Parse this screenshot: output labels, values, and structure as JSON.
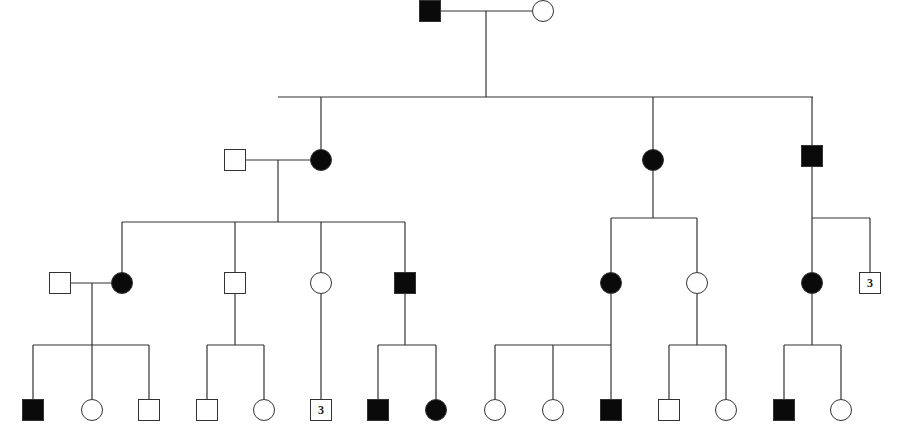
{
  "diagram": {
    "type": "pedigree",
    "legend_colors": {
      "affected": "#0a0a0a",
      "unaffected": "#ffffff",
      "line": "#333333"
    },
    "individuals": [
      {
        "id": "I-1",
        "gen": 1,
        "sex": "male",
        "affected": true,
        "x": 430,
        "y": 11
      },
      {
        "id": "I-2",
        "gen": 1,
        "sex": "female",
        "affected": false,
        "x": 543,
        "y": 11
      },
      {
        "id": "II-spouse",
        "gen": 2,
        "sex": "male",
        "affected": false,
        "x": 235,
        "y": 160
      },
      {
        "id": "II-1",
        "gen": 2,
        "sex": "female",
        "affected": true,
        "x": 321,
        "y": 160
      },
      {
        "id": "II-2",
        "gen": 2,
        "sex": "female",
        "affected": true,
        "x": 653,
        "y": 160
      },
      {
        "id": "II-3",
        "gen": 2,
        "sex": "male",
        "affected": true,
        "x": 812,
        "y": 156
      },
      {
        "id": "III-spouse",
        "gen": 3,
        "sex": "male",
        "affected": false,
        "x": 60,
        "y": 283
      },
      {
        "id": "III-1",
        "gen": 3,
        "sex": "female",
        "affected": true,
        "x": 122,
        "y": 283
      },
      {
        "id": "III-2",
        "gen": 3,
        "sex": "male",
        "affected": false,
        "x": 235,
        "y": 283
      },
      {
        "id": "III-3",
        "gen": 3,
        "sex": "female",
        "affected": false,
        "x": 321,
        "y": 283
      },
      {
        "id": "III-4",
        "gen": 3,
        "sex": "male",
        "affected": true,
        "x": 405,
        "y": 283
      },
      {
        "id": "III-5",
        "gen": 3,
        "sex": "female",
        "affected": true,
        "x": 611,
        "y": 283
      },
      {
        "id": "III-6",
        "gen": 3,
        "sex": "female",
        "affected": false,
        "x": 697,
        "y": 283
      },
      {
        "id": "III-7",
        "gen": 3,
        "sex": "female",
        "affected": true,
        "x": 812,
        "y": 283
      },
      {
        "id": "III-8",
        "gen": 3,
        "sex": "male",
        "affected": false,
        "x": 870,
        "y": 283,
        "count": "3"
      },
      {
        "id": "IV-1",
        "gen": 4,
        "sex": "male",
        "affected": true,
        "x": 33,
        "y": 410
      },
      {
        "id": "IV-2",
        "gen": 4,
        "sex": "female",
        "affected": false,
        "x": 92,
        "y": 410
      },
      {
        "id": "IV-3",
        "gen": 4,
        "sex": "male",
        "affected": false,
        "x": 149,
        "y": 410
      },
      {
        "id": "IV-4",
        "gen": 4,
        "sex": "male",
        "affected": false,
        "x": 207,
        "y": 410
      },
      {
        "id": "IV-5",
        "gen": 4,
        "sex": "female",
        "affected": false,
        "x": 264,
        "y": 410
      },
      {
        "id": "IV-6",
        "gen": 4,
        "sex": "male",
        "affected": false,
        "x": 321,
        "y": 410,
        "count": "3"
      },
      {
        "id": "IV-7",
        "gen": 4,
        "sex": "male",
        "affected": true,
        "x": 378,
        "y": 410
      },
      {
        "id": "IV-8",
        "gen": 4,
        "sex": "female",
        "affected": true,
        "x": 436,
        "y": 410
      },
      {
        "id": "IV-9",
        "gen": 4,
        "sex": "female",
        "affected": false,
        "x": 495,
        "y": 410
      },
      {
        "id": "IV-10",
        "gen": 4,
        "sex": "female",
        "affected": false,
        "x": 553,
        "y": 410
      },
      {
        "id": "IV-11",
        "gen": 4,
        "sex": "male",
        "affected": true,
        "x": 611,
        "y": 410
      },
      {
        "id": "IV-12",
        "gen": 4,
        "sex": "male",
        "affected": false,
        "x": 669,
        "y": 410
      },
      {
        "id": "IV-13",
        "gen": 4,
        "sex": "female",
        "affected": false,
        "x": 726,
        "y": 410
      },
      {
        "id": "IV-14",
        "gen": 4,
        "sex": "male",
        "affected": true,
        "x": 784,
        "y": 410
      },
      {
        "id": "IV-15",
        "gen": 4,
        "sex": "female",
        "affected": false,
        "x": 841,
        "y": 410
      }
    ],
    "lines": [
      [
        441,
        11,
        532,
        11
      ],
      [
        486,
        11,
        486,
        97
      ],
      [
        278,
        97,
        813,
        97
      ],
      [
        321,
        97,
        321,
        149
      ],
      [
        653,
        97,
        653,
        149
      ],
      [
        812,
        97,
        812,
        145
      ],
      [
        246,
        160,
        310,
        160
      ],
      [
        278,
        160,
        278,
        222
      ],
      [
        122,
        222,
        405,
        222
      ],
      [
        122,
        222,
        122,
        272
      ],
      [
        235,
        222,
        235,
        272
      ],
      [
        321,
        222,
        321,
        272
      ],
      [
        405,
        222,
        405,
        272
      ],
      [
        653,
        171,
        653,
        218
      ],
      [
        611,
        218,
        697,
        218
      ],
      [
        611,
        218,
        611,
        272
      ],
      [
        697,
        218,
        697,
        272
      ],
      [
        812,
        167,
        812,
        218
      ],
      [
        812,
        218,
        870,
        218
      ],
      [
        812,
        218,
        812,
        272
      ],
      [
        870,
        218,
        870,
        272
      ],
      [
        71,
        283,
        111,
        283
      ],
      [
        92,
        283,
        92,
        345
      ],
      [
        33,
        345,
        149,
        345
      ],
      [
        33,
        345,
        33,
        399
      ],
      [
        92,
        345,
        92,
        399
      ],
      [
        149,
        345,
        149,
        399
      ],
      [
        235,
        294,
        235,
        345
      ],
      [
        207,
        345,
        264,
        345
      ],
      [
        207,
        345,
        207,
        399
      ],
      [
        264,
        345,
        264,
        399
      ],
      [
        321,
        294,
        321,
        399
      ],
      [
        405,
        294,
        405,
        345
      ],
      [
        378,
        345,
        436,
        345
      ],
      [
        378,
        345,
        378,
        399
      ],
      [
        436,
        345,
        436,
        399
      ],
      [
        611,
        294,
        611,
        345
      ],
      [
        495,
        345,
        611,
        345
      ],
      [
        495,
        345,
        495,
        399
      ],
      [
        553,
        345,
        553,
        399
      ],
      [
        611,
        345,
        611,
        399
      ],
      [
        697,
        294,
        697,
        345
      ],
      [
        669,
        345,
        726,
        345
      ],
      [
        669,
        345,
        669,
        399
      ],
      [
        726,
        345,
        726,
        399
      ],
      [
        812,
        294,
        812,
        345
      ],
      [
        784,
        345,
        841,
        345
      ],
      [
        784,
        345,
        784,
        399
      ],
      [
        841,
        345,
        841,
        399
      ]
    ]
  }
}
